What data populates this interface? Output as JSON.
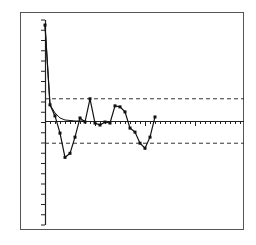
{
  "chart_data": {
    "type": "line",
    "title": "",
    "xlabel": "",
    "ylabel": "",
    "ylim": [
      -1.0,
      1.0
    ],
    "grid": false,
    "legend": null,
    "y_ticks_count": 21,
    "x_ticks_count": 40,
    "confidence_band": {
      "upper": 0.22,
      "lower": -0.22,
      "style": "dashed"
    },
    "series": [
      {
        "name": "sample",
        "markers": true,
        "x": [
          0,
          1,
          2,
          3,
          4,
          5,
          6,
          7,
          8,
          9,
          10,
          11,
          12,
          13,
          14,
          15,
          16,
          17,
          18,
          19,
          20,
          21,
          22
        ],
        "values": [
          0.95,
          0.16,
          0.05,
          -0.12,
          -0.36,
          -0.32,
          -0.16,
          0.03,
          -0.01,
          0.22,
          -0.02,
          -0.04,
          -0.01,
          -0.02,
          0.15,
          0.14,
          0.09,
          -0.07,
          -0.11,
          -0.22,
          -0.27,
          -0.16,
          0.04
        ]
      },
      {
        "name": "theoretical",
        "markers": false,
        "x": [
          0,
          1,
          2,
          3,
          4,
          5,
          6,
          7,
          8
        ],
        "values": [
          0.95,
          0.16,
          0.08,
          0.03,
          0.01,
          0.005,
          0.0,
          0.0,
          0.0
        ]
      }
    ]
  },
  "colors": {
    "frame": "#555555",
    "line": "#111111",
    "dashed": "#333333",
    "axis": "#222222"
  }
}
